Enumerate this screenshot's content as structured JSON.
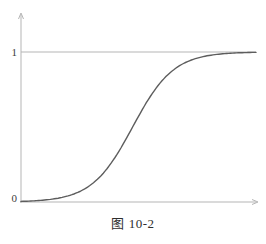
{
  "figure": {
    "caption": "图 10-2"
  },
  "colors": {
    "axis": "#b5b5b5",
    "curve": "#5d5d5d",
    "label": "#3c3c3c"
  },
  "chart_data": {
    "type": "line",
    "title": "图 10-2",
    "xlabel": "",
    "ylabel": "",
    "x_range": [
      0,
      1
    ],
    "y_range": [
      0,
      1.08
    ],
    "grid": false,
    "legend": false,
    "y_ticks": [
      {
        "value": 0,
        "label": "0"
      },
      {
        "value": 1,
        "label": "1"
      }
    ],
    "asymptote": {
      "value": 1,
      "description": "horizontal reference line at y = 1 from y-axis to right edge"
    },
    "series": [
      {
        "name": "sigmoid-curve",
        "function": "logistic y = 1/(1+exp(-k*(x-x0)))",
        "logistic_params": {
          "k": 11.5,
          "x0": 0.475
        },
        "x": [
          0,
          0.05,
          0.1,
          0.15,
          0.2,
          0.25,
          0.3,
          0.35,
          0.4,
          0.45,
          0.5,
          0.55,
          0.6,
          0.65,
          0.7,
          0.75,
          0.8,
          0.85,
          0.9,
          0.95,
          1.0
        ],
        "y": [
          0.0042,
          0.0074,
          0.0131,
          0.023,
          0.0401,
          0.0692,
          0.1167,
          0.1903,
          0.295,
          0.4274,
          0.5715,
          0.7029,
          0.8073,
          0.8809,
          0.9284,
          0.9583,
          0.9761,
          0.9864,
          0.9923,
          0.9956,
          0.9975
        ]
      }
    ]
  }
}
